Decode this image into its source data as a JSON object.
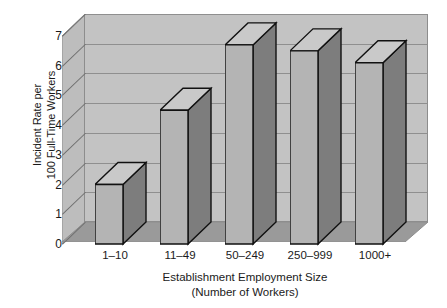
{
  "chart_data": {
    "type": "bar",
    "title": "",
    "subtitle": "",
    "xlabel": "Establishment Employment Size",
    "xlabel_line2": "(Number of Workers)",
    "ylabel": "Incident Rate per",
    "ylabel_line2": "100 Full-Time Workers",
    "categories": [
      "1–10",
      "11–49",
      "50–249",
      "250–999",
      "1000+"
    ],
    "values": [
      2.0,
      4.5,
      6.7,
      6.5,
      6.1
    ],
    "ylim": [
      0,
      7
    ],
    "ytick_labels": [
      "0",
      "1",
      "2",
      "3",
      "4",
      "5",
      "6",
      "7"
    ],
    "ytick_values": [
      0,
      1,
      2,
      3,
      4,
      5,
      6,
      7
    ],
    "grid": true,
    "legend": "none",
    "style": "3d-column",
    "colors": {
      "bar_front": "#b4b4b4",
      "bar_side": "#7d7d7d",
      "bar_top": "#c9c9c9",
      "bar_outline": "#111111",
      "plot_back_wall": "#c3c3c3",
      "plot_left_wall": "#bdbdbd",
      "plot_floor": "#9a9a9a",
      "gridline": "#8f8f8f",
      "text": "#1a1a1a",
      "background": "#ffffff"
    }
  }
}
